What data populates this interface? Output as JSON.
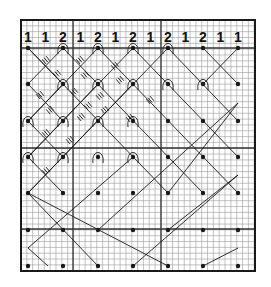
{
  "diagram": {
    "bg_color": "#ffffff",
    "ink_color": "#1a1a1a",
    "grid_color": "#9a9a9a",
    "border": {
      "x": 21,
      "y": 20,
      "w": 234,
      "h": 251
    },
    "grid": {
      "x0": 21,
      "y0": 20,
      "x1": 255,
      "y1": 271,
      "step": 5.83
    },
    "thick_lines": {
      "vertical": [
        73,
        161
      ],
      "horizontal": [
        48,
        148,
        229
      ]
    },
    "pair_counts": {
      "y": 42,
      "x_start": 28,
      "x_step": 17.5,
      "values": [
        "1",
        "1",
        "2",
        "1",
        "2",
        "1",
        "2",
        "1",
        "2",
        "1",
        "2",
        "1",
        "1"
      ]
    },
    "pins": {
      "columns": [
        28,
        63,
        98,
        133,
        168,
        203,
        238
      ],
      "rows": [
        48,
        84,
        121,
        157,
        193,
        230,
        266
      ]
    },
    "looped_pins": [
      [
        63,
        48
      ],
      [
        98,
        48
      ],
      [
        133,
        48
      ],
      [
        168,
        48
      ],
      [
        63,
        84
      ],
      [
        98,
        84
      ],
      [
        133,
        84
      ],
      [
        168,
        84
      ],
      [
        203,
        84
      ],
      [
        28,
        121
      ],
      [
        63,
        121
      ],
      [
        98,
        121
      ],
      [
        133,
        121
      ],
      [
        28,
        157
      ],
      [
        63,
        157
      ],
      [
        98,
        157
      ],
      [
        133,
        157
      ]
    ],
    "threads": [
      [
        28,
        48,
        63,
        84
      ],
      [
        28,
        48,
        168,
        193
      ],
      [
        63,
        48,
        28,
        84
      ],
      [
        63,
        48,
        203,
        193
      ],
      [
        98,
        48,
        28,
        121
      ],
      [
        98,
        48,
        238,
        193
      ],
      [
        133,
        48,
        28,
        157
      ],
      [
        133,
        48,
        238,
        157
      ],
      [
        168,
        48,
        28,
        193
      ],
      [
        168,
        48,
        238,
        121
      ],
      [
        203,
        48,
        238,
        84
      ],
      [
        238,
        48,
        203,
        84
      ],
      [
        28,
        84,
        63,
        121
      ],
      [
        28,
        84,
        28,
        84
      ],
      [
        63,
        84,
        28,
        121
      ],
      [
        98,
        84,
        28,
        157
      ],
      [
        133,
        84,
        28,
        193
      ],
      [
        28,
        121,
        63,
        157
      ],
      [
        28,
        157,
        63,
        193
      ],
      [
        28,
        193,
        98,
        266
      ],
      [
        28,
        193,
        168,
        266
      ],
      [
        238,
        103,
        168,
        193
      ],
      [
        238,
        175,
        133,
        266
      ],
      [
        238,
        248,
        203,
        266
      ],
      [
        28,
        248,
        133,
        157
      ],
      [
        28,
        248,
        48,
        266
      ],
      [
        238,
        103,
        98,
        230
      ],
      [
        238,
        175,
        168,
        230
      ]
    ],
    "tally_marks": [
      [
        46,
        60
      ],
      [
        57,
        74
      ],
      [
        40,
        95
      ],
      [
        50,
        110
      ],
      [
        80,
        60
      ],
      [
        85,
        75
      ],
      [
        74,
        92
      ],
      [
        88,
        106
      ],
      [
        70,
        140
      ],
      [
        46,
        133
      ],
      [
        46,
        171
      ],
      [
        81,
        117
      ],
      [
        100,
        96
      ],
      [
        115,
        66
      ],
      [
        120,
        80
      ],
      [
        105,
        110
      ],
      [
        150,
        100
      ],
      [
        130,
        118
      ]
    ]
  }
}
